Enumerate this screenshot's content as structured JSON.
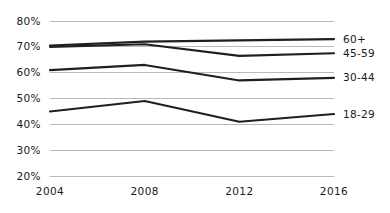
{
  "chart_data": {
    "type": "line",
    "title": "",
    "subtitle": "",
    "xlabel": "",
    "ylabel": "",
    "grid": true,
    "legend_position": "right-inline-end-of-line",
    "x": [
      "2004",
      "2008",
      "2012",
      "2016"
    ],
    "categories": [
      "2004",
      "2008",
      "2012",
      "2016"
    ],
    "xtick_labels": [
      "2004",
      "2008",
      "2012",
      "2016"
    ],
    "ytick_labels": [
      "20%",
      "30%",
      "40%",
      "50%",
      "60%",
      "70%",
      "80%"
    ],
    "ytick_values": [
      20,
      30,
      40,
      50,
      60,
      70,
      80
    ],
    "ylim": [
      20,
      80
    ],
    "series": [
      {
        "name": "60+",
        "values": [
          70.5,
          72.0,
          72.5,
          73.0
        ]
      },
      {
        "name": "45-59",
        "values": [
          70.0,
          71.0,
          66.5,
          67.5
        ]
      },
      {
        "name": "30-44",
        "values": [
          61.0,
          63.0,
          57.0,
          58.0
        ]
      },
      {
        "name": "18-29",
        "values": [
          45.0,
          49.0,
          41.0,
          44.0
        ]
      }
    ],
    "line_color": "#1f1f1f",
    "grid_color": "#b9b9b9",
    "background_color": "#ffffff"
  }
}
